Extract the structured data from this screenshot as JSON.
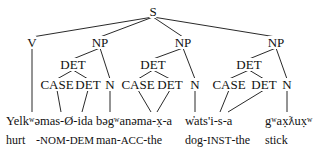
{
  "tree": {
    "root": "S",
    "nodes": [
      {
        "id": "S",
        "label": "S",
        "x": 153,
        "y": 5
      },
      {
        "id": "V",
        "label": "V",
        "x": 32,
        "y": 36
      },
      {
        "id": "NP1",
        "label": "NP",
        "x": 100,
        "y": 36
      },
      {
        "id": "NP2",
        "label": "NP",
        "x": 183,
        "y": 36
      },
      {
        "id": "NP3",
        "label": "NP",
        "x": 276,
        "y": 36
      },
      {
        "id": "DET1",
        "label": "DET",
        "x": 73,
        "y": 58
      },
      {
        "id": "DET2",
        "label": "DET",
        "x": 153,
        "y": 58
      },
      {
        "id": "DET3",
        "label": "DET",
        "x": 249,
        "y": 58
      },
      {
        "id": "CASE1",
        "label": "CASE",
        "x": 57,
        "y": 78
      },
      {
        "id": "DET1b",
        "label": "DET",
        "x": 88,
        "y": 78
      },
      {
        "id": "N1",
        "label": "N",
        "x": 110,
        "y": 78
      },
      {
        "id": "CASE2",
        "label": "CASE",
        "x": 138,
        "y": 78
      },
      {
        "id": "DET2b",
        "label": "DET",
        "x": 170,
        "y": 78
      },
      {
        "id": "N2",
        "label": "N",
        "x": 195,
        "y": 78
      },
      {
        "id": "CASE3",
        "label": "CASE",
        "x": 229,
        "y": 78
      },
      {
        "id": "DET3b",
        "label": "DET",
        "x": 264,
        "y": 78
      },
      {
        "id": "N3",
        "label": "N",
        "x": 287,
        "y": 78
      }
    ],
    "edges": [
      [
        "S",
        "V"
      ],
      [
        "S",
        "NP1"
      ],
      [
        "S",
        "NP2"
      ],
      [
        "S",
        "NP3"
      ],
      [
        "NP1",
        "DET1"
      ],
      [
        "NP1",
        "N1"
      ],
      [
        "NP2",
        "DET2"
      ],
      [
        "NP2",
        "N2"
      ],
      [
        "NP3",
        "DET3"
      ],
      [
        "NP3",
        "N3"
      ],
      [
        "DET1",
        "CASE1"
      ],
      [
        "DET1",
        "DET1b"
      ],
      [
        "DET2",
        "CASE2"
      ],
      [
        "DET2",
        "DET2b"
      ],
      [
        "DET3",
        "CASE3"
      ],
      [
        "DET3",
        "DET3b"
      ]
    ],
    "leaf_lines": [
      {
        "from": "V",
        "x2": 32,
        "y2": 112
      },
      {
        "from": "CASE1",
        "x2": 61,
        "y2": 112
      },
      {
        "from": "DET1b",
        "x2": 82,
        "y2": 112
      },
      {
        "from": "N1",
        "x2": 110,
        "y2": 112
      },
      {
        "from": "CASE2",
        "x2": 151,
        "y2": 112
      },
      {
        "from": "DET2b",
        "x2": 157,
        "y2": 112
      },
      {
        "from": "N2",
        "x2": 195,
        "y2": 112
      },
      {
        "from": "CASE3",
        "x2": 220,
        "y2": 112
      },
      {
        "from": "DET3b",
        "x2": 228,
        "y2": 112
      },
      {
        "from": "N3",
        "x2": 287,
        "y2": 112
      }
    ]
  },
  "words": [
    {
      "text": "Yelkʷəmas-Ø-ida",
      "x": 6,
      "y": 115
    },
    {
      "text": "bəgʷanəma-x̣-a",
      "x": 96,
      "y": 115
    },
    {
      "text": "w̓ats'i-s-a",
      "x": 185,
      "y": 115
    },
    {
      "text": "gʷax̣ƛux̣ʷ",
      "x": 265,
      "y": 115
    }
  ],
  "glosses": [
    {
      "text": "hurt",
      "x": 6,
      "y": 134
    },
    {
      "text": "-NOM-DEM",
      "x": 36,
      "y": 134,
      "smallcaps": true
    },
    {
      "text": "man-ACC-the",
      "x": 96,
      "y": 134
    },
    {
      "text": "dog-INST-the",
      "x": 185,
      "y": 134
    },
    {
      "text": "stick",
      "x": 265,
      "y": 134
    }
  ],
  "colors": {
    "ink": "#111111",
    "background": "#ffffff"
  }
}
